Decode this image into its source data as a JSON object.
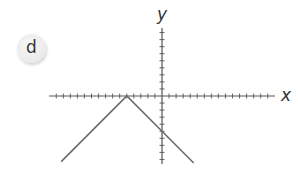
{
  "panel": {
    "label": "d"
  },
  "chart_data": {
    "type": "line",
    "title": "",
    "xlabel": "x",
    "ylabel": "y",
    "function": "y = -|x + 5|",
    "grid": false,
    "tick_spacing": 1,
    "xlim": [
      -16,
      16
    ],
    "ylim": [
      -10,
      10
    ],
    "series": [
      {
        "name": "y = -|x + 5|",
        "color": "#6b6b6b",
        "points": [
          [
            -14.3,
            -9.3
          ],
          [
            -5,
            0
          ],
          [
            0,
            -5
          ],
          [
            4.5,
            -9.5
          ]
        ]
      }
    ],
    "annotations": {
      "vertex": [
        -5,
        0
      ],
      "y_intercept": [
        0,
        -5
      ]
    }
  },
  "colors": {
    "axis": "#555555",
    "line": "#6b6b6b",
    "badge": "#ececec"
  }
}
